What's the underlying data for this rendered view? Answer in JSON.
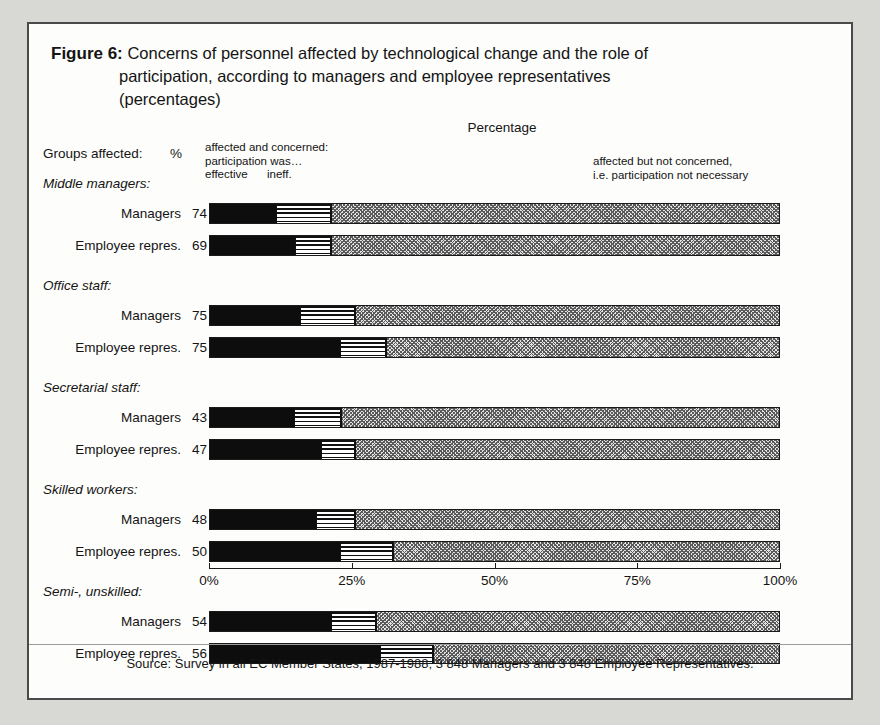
{
  "figure": {
    "label": "Figure 6:",
    "title_line1": "Concerns of personnel affected by technological change and the role of",
    "title_line2": "participation, according to managers and employee representatives",
    "title_line3": "(percentages)"
  },
  "header": {
    "percentage_caption": "Percentage",
    "groups_affected_label": "Groups affected:",
    "pct_column_header": "%",
    "legend_left_line1": "affected and concerned:",
    "legend_left_line2": "participation was…",
    "legend_left_effective": "effective",
    "legend_left_ineffective": "ineff.",
    "legend_right_line1": "affected but not concerned,",
    "legend_right_line2": "i.e. participation not necessary"
  },
  "axis": {
    "ticks": [
      "0%",
      "25%",
      "50%",
      "75%",
      "100%"
    ],
    "tick_values": [
      0,
      25,
      50,
      75,
      100
    ]
  },
  "source": "Source: Survey in all EC Member States, 1987-1988; 3 848 Managers and 3 848 Employee Representatives.",
  "colors": {
    "effective": "#0d0d0d",
    "ineffective": "#111111",
    "not_concerned": "#e3e3e3",
    "frame": "#4a4a4a",
    "page_background": "#d8d8d4",
    "card_background": "#fdfdfb"
  },
  "chart_data": {
    "type": "bar",
    "orientation": "horizontal",
    "stacked": true,
    "title": "Concerns of personnel affected by technological change and the role of participation, according to managers and employee representatives (percentages)",
    "xlabel": "Percentage",
    "ylabel": "",
    "xlim": [
      0,
      100
    ],
    "grid": false,
    "legend_position": "top",
    "series": [
      {
        "name": "affected and concerned: participation was effective",
        "key": "effective"
      },
      {
        "name": "affected and concerned: participation was ineffective",
        "key": "ineffective"
      },
      {
        "name": "affected but not concerned, i.e. participation not necessary",
        "key": "not_concerned"
      }
    ],
    "groups": [
      {
        "group": "Middle managers:",
        "rows": [
          {
            "label": "Managers",
            "pct_affected": 74,
            "effective": 11.6,
            "ineffective": 9.6,
            "not_concerned": 78.8
          },
          {
            "label": "Employee repres.",
            "pct_affected": 69,
            "effective": 14.9,
            "ineffective": 6.3,
            "not_concerned": 78.8
          }
        ]
      },
      {
        "group": "Office staff:",
        "rows": [
          {
            "label": "Managers",
            "pct_affected": 75,
            "effective": 15.8,
            "ineffective": 9.6,
            "not_concerned": 74.6
          },
          {
            "label": "Employee repres.",
            "pct_affected": 75,
            "effective": 22.8,
            "ineffective": 8.0,
            "not_concerned": 69.2
          }
        ]
      },
      {
        "group": "Secretarial staff:",
        "rows": [
          {
            "label": "Managers",
            "pct_affected": 43,
            "effective": 14.7,
            "ineffective": 8.3,
            "not_concerned": 77.0
          },
          {
            "label": "Employee repres.",
            "pct_affected": 47,
            "effective": 19.4,
            "ineffective": 6.0,
            "not_concerned": 74.6
          }
        ]
      },
      {
        "group": "Skilled workers:",
        "rows": [
          {
            "label": "Managers",
            "pct_affected": 48,
            "effective": 18.6,
            "ineffective": 6.8,
            "not_concerned": 74.6
          },
          {
            "label": "Employee repres.",
            "pct_affected": 50,
            "effective": 22.8,
            "ineffective": 9.2,
            "not_concerned": 68.0
          }
        ]
      },
      {
        "group": "Semi-, unskilled:",
        "rows": [
          {
            "label": "Managers",
            "pct_affected": 54,
            "effective": 21.2,
            "ineffective": 7.9,
            "not_concerned": 70.9
          },
          {
            "label": "Employee repres.",
            "pct_affected": 56,
            "effective": 29.8,
            "ineffective": 9.3,
            "not_concerned": 60.9
          }
        ]
      }
    ]
  }
}
